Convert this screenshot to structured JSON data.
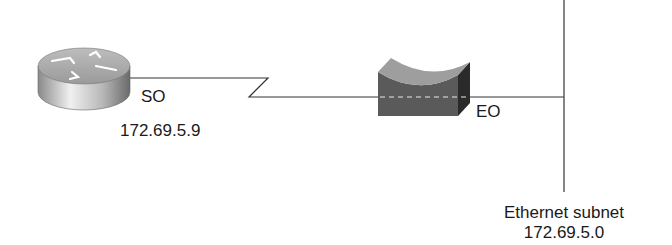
{
  "diagram": {
    "router": {
      "icon": "router-icon",
      "interface_label": "SO",
      "ip_address": "172.69.5.9"
    },
    "serial_link": {
      "icon": "serial-lightning-link"
    },
    "bridge_device": {
      "icon": "bridge-device-icon",
      "interface_label": "EO"
    },
    "ethernet_segment": {
      "label": "Ethernet subnet",
      "network": "172.69.5.0"
    }
  }
}
